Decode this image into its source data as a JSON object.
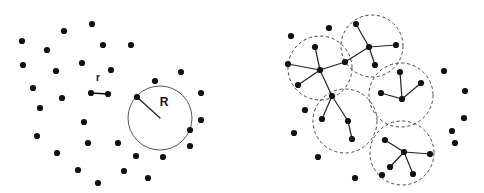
{
  "figure": {
    "width": 484,
    "height": 193,
    "background_color": "#ffffff",
    "point_color": "#111111",
    "point_radius": 3.1,
    "solid_circle_color": "#555555",
    "dashed_circle_color": "#444444",
    "edge_color": "#222222",
    "label_color": "#111111"
  },
  "chart_data": {
    "type": "scatter",
    "title": "",
    "subtitle": "",
    "xlabel": "",
    "ylabel": "",
    "grid": false,
    "legend": "none",
    "xlim": [
      0,
      484
    ],
    "ylim": [
      0,
      193
    ],
    "panels": [
      {
        "name": "left-panel",
        "annotations": [
          {
            "label": "r",
            "kind": "segment-length-label",
            "label_x": 98,
            "label_y": 81,
            "segment": {
              "x1": 91,
              "y1": 93,
              "x2": 108,
              "y2": 94
            },
            "endpoints": [
              {
                "x": 91,
                "y": 93
              },
              {
                "x": 108,
                "y": 94
              }
            ]
          },
          {
            "label": "R",
            "kind": "radius-label",
            "label_x": 164,
            "label_y": 106,
            "circle": {
              "cx": 160,
              "cy": 118,
              "r": 32,
              "style": "solid"
            },
            "radius_line": {
              "x1": 160,
              "y1": 118,
              "x2": 137,
              "y2": 97
            }
          }
        ],
        "points": [
          {
            "x": 92,
            "y": 24
          },
          {
            "x": 64,
            "y": 31
          },
          {
            "x": 22,
            "y": 41
          },
          {
            "x": 47,
            "y": 50
          },
          {
            "x": 103,
            "y": 45
          },
          {
            "x": 131,
            "y": 45
          },
          {
            "x": 82,
            "y": 63
          },
          {
            "x": 23,
            "y": 65
          },
          {
            "x": 56,
            "y": 71
          },
          {
            "x": 111,
            "y": 70
          },
          {
            "x": 181,
            "y": 72
          },
          {
            "x": 33,
            "y": 88
          },
          {
            "x": 91,
            "y": 93
          },
          {
            "x": 108,
            "y": 94
          },
          {
            "x": 155,
            "y": 81
          },
          {
            "x": 137,
            "y": 97
          },
          {
            "x": 201,
            "y": 93
          },
          {
            "x": 40,
            "y": 108
          },
          {
            "x": 62,
            "y": 98
          },
          {
            "x": 201,
            "y": 120
          },
          {
            "x": 84,
            "y": 122
          },
          {
            "x": 190,
            "y": 130
          },
          {
            "x": 37,
            "y": 136
          },
          {
            "x": 88,
            "y": 143
          },
          {
            "x": 118,
            "y": 143
          },
          {
            "x": 190,
            "y": 146
          },
          {
            "x": 57,
            "y": 153
          },
          {
            "x": 136,
            "y": 156
          },
          {
            "x": 163,
            "y": 157
          },
          {
            "x": 78,
            "y": 170
          },
          {
            "x": 124,
            "y": 171
          },
          {
            "x": 98,
            "y": 183
          },
          {
            "x": 148,
            "y": 178
          }
        ]
      },
      {
        "name": "right-panel",
        "circles": [
          {
            "cx": 372,
            "cy": 46,
            "r": 31,
            "style": "dashed"
          },
          {
            "cx": 320,
            "cy": 68,
            "r": 32,
            "style": "dashed"
          },
          {
            "cx": 401,
            "cy": 95,
            "r": 32,
            "style": "dashed"
          },
          {
            "cx": 345,
            "cy": 121,
            "r": 32,
            "style": "dashed"
          },
          {
            "cx": 402,
            "cy": 153,
            "r": 32,
            "style": "dashed"
          }
        ],
        "clusters": [
          {
            "hub": {
              "x": 369,
              "y": 47
            },
            "leaves": [
              {
                "x": 356,
                "y": 24
              },
              {
                "x": 396,
                "y": 45
              },
              {
                "x": 375,
                "y": 65
              },
              {
                "x": 345,
                "y": 62
              }
            ]
          },
          {
            "hub": {
              "x": 320,
              "y": 70
            },
            "leaves": [
              {
                "x": 315,
                "y": 47
              },
              {
                "x": 288,
                "y": 64
              },
              {
                "x": 298,
                "y": 85
              },
              {
                "x": 332,
                "y": 96
              },
              {
                "x": 345,
                "y": 62
              }
            ]
          },
          {
            "hub": {
              "x": 402,
              "y": 99
            },
            "leaves": [
              {
                "x": 400,
                "y": 72
              },
              {
                "x": 421,
                "y": 83
              },
              {
                "x": 381,
                "y": 93
              }
            ]
          },
          {
            "hub": {
              "x": 348,
              "y": 121
            },
            "leaves": [
              {
                "x": 332,
                "y": 96
              },
              {
                "x": 352,
                "y": 139
              }
            ],
            "extra_edges": [
              {
                "x1": 332,
                "y1": 96,
                "x2": 322,
                "y2": 119
              }
            ]
          },
          {
            "hub": {
              "x": 404,
              "y": 152
            },
            "leaves": [
              {
                "x": 385,
                "y": 140
              },
              {
                "x": 430,
                "y": 154
              },
              {
                "x": 390,
                "y": 167
              },
              {
                "x": 413,
                "y": 174
              }
            ]
          }
        ],
        "points": [
          {
            "x": 329,
            "y": 28
          },
          {
            "x": 291,
            "y": 36
          },
          {
            "x": 356,
            "y": 24
          },
          {
            "x": 315,
            "y": 47
          },
          {
            "x": 369,
            "y": 47
          },
          {
            "x": 396,
            "y": 45
          },
          {
            "x": 345,
            "y": 62
          },
          {
            "x": 288,
            "y": 64
          },
          {
            "x": 375,
            "y": 65
          },
          {
            "x": 400,
            "y": 72
          },
          {
            "x": 444,
            "y": 71
          },
          {
            "x": 320,
            "y": 70
          },
          {
            "x": 421,
            "y": 83
          },
          {
            "x": 298,
            "y": 85
          },
          {
            "x": 381,
            "y": 93
          },
          {
            "x": 402,
            "y": 99
          },
          {
            "x": 332,
            "y": 96
          },
          {
            "x": 465,
            "y": 91
          },
          {
            "x": 305,
            "y": 110
          },
          {
            "x": 348,
            "y": 121
          },
          {
            "x": 322,
            "y": 119
          },
          {
            "x": 464,
            "y": 118
          },
          {
            "x": 294,
            "y": 133
          },
          {
            "x": 352,
            "y": 139
          },
          {
            "x": 385,
            "y": 140
          },
          {
            "x": 452,
            "y": 131
          },
          {
            "x": 455,
            "y": 143
          },
          {
            "x": 404,
            "y": 152
          },
          {
            "x": 430,
            "y": 154
          },
          {
            "x": 318,
            "y": 157
          },
          {
            "x": 390,
            "y": 167
          },
          {
            "x": 413,
            "y": 174
          },
          {
            "x": 355,
            "y": 178
          },
          {
            "x": 382,
            "y": 175
          }
        ]
      }
    ]
  }
}
